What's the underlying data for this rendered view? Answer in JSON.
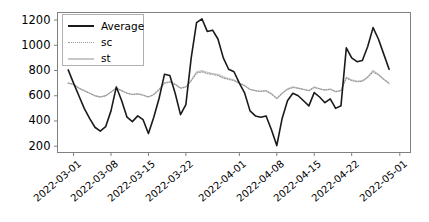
{
  "chart_data": {
    "type": "line",
    "title": "",
    "xlabel": "",
    "ylabel": "",
    "ylim": [
      150,
      1260
    ],
    "xlim": [
      "2022-02-26",
      "2022-05-03"
    ],
    "grid": false,
    "legend_position": "upper left",
    "y_ticks": [
      200,
      400,
      600,
      800,
      1000,
      1200
    ],
    "y_tick_labels": [
      "200",
      "400",
      "600",
      "800",
      "1000",
      "1200"
    ],
    "x_ticks": [
      "2022-03-01",
      "2022-03-08",
      "2022-03-15",
      "2022-03-22",
      "2022-04-01",
      "2022-04-08",
      "2022-04-15",
      "2022-04-22",
      "2022-05-01"
    ],
    "x_tick_labels": [
      "2022-03-01",
      "2022-03-08",
      "2022-03-15",
      "2022-03-22",
      "2022-04-01",
      "2022-04-08",
      "2022-04-15",
      "2022-04-22",
      "2022-05-01"
    ],
    "x": [
      "2022-02-28",
      "2022-03-01",
      "2022-03-02",
      "2022-03-03",
      "2022-03-04",
      "2022-03-05",
      "2022-03-06",
      "2022-03-07",
      "2022-03-08",
      "2022-03-09",
      "2022-03-10",
      "2022-03-11",
      "2022-03-12",
      "2022-03-13",
      "2022-03-14",
      "2022-03-15",
      "2022-03-16",
      "2022-03-17",
      "2022-03-18",
      "2022-03-19",
      "2022-03-20",
      "2022-03-21",
      "2022-03-22",
      "2022-03-23",
      "2022-03-24",
      "2022-03-25",
      "2022-03-26",
      "2022-03-27",
      "2022-03-28",
      "2022-03-29",
      "2022-03-30",
      "2022-03-31",
      "2022-04-01",
      "2022-04-02",
      "2022-04-03",
      "2022-04-04",
      "2022-04-05",
      "2022-04-06",
      "2022-04-07",
      "2022-04-08",
      "2022-04-09",
      "2022-04-10",
      "2022-04-11",
      "2022-04-12",
      "2022-04-13",
      "2022-04-14",
      "2022-04-15",
      "2022-04-16",
      "2022-04-17",
      "2022-04-18",
      "2022-04-19",
      "2022-04-20",
      "2022-04-21",
      "2022-04-22",
      "2022-04-23",
      "2022-04-24",
      "2022-04-25",
      "2022-04-26",
      "2022-04-27",
      "2022-04-28",
      "2022-04-29"
    ],
    "series": [
      {
        "name": "Average",
        "color": "#1a1a1a",
        "linestyle": "solid",
        "linewidth": 1.6,
        "values": [
          805,
          700,
          600,
          500,
          420,
          350,
          320,
          355,
          480,
          670,
          560,
          430,
          395,
          440,
          410,
          300,
          430,
          580,
          770,
          760,
          620,
          450,
          530,
          900,
          1180,
          1210,
          1110,
          1120,
          1050,
          900,
          810,
          790,
          700,
          620,
          480,
          440,
          430,
          440,
          330,
          205,
          420,
          560,
          620,
          600,
          560,
          520,
          625,
          590,
          545,
          575,
          500,
          520,
          980,
          900,
          870,
          880,
          990,
          1140,
          1050,
          930,
          810
        ]
      },
      {
        "name": "sc",
        "color": "#9a9a9a",
        "linestyle": "dotted",
        "linewidth": 1.2,
        "values": [
          700,
          690,
          660,
          640,
          620,
          600,
          590,
          600,
          630,
          660,
          640,
          620,
          610,
          615,
          605,
          590,
          610,
          650,
          700,
          710,
          690,
          660,
          670,
          720,
          780,
          790,
          775,
          770,
          760,
          740,
          730,
          720,
          700,
          680,
          650,
          640,
          635,
          640,
          615,
          580,
          620,
          650,
          665,
          660,
          650,
          640,
          665,
          655,
          645,
          650,
          635,
          640,
          740,
          720,
          710,
          715,
          745,
          790,
          765,
          730,
          700
        ]
      },
      {
        "name": "st",
        "color": "#c8c8c8",
        "linestyle": "solid",
        "linewidth": 1.3,
        "values": [
          700,
          690,
          660,
          640,
          620,
          600,
          590,
          600,
          630,
          660,
          640,
          620,
          610,
          615,
          605,
          590,
          610,
          650,
          700,
          710,
          690,
          660,
          670,
          720,
          790,
          800,
          785,
          775,
          770,
          750,
          735,
          725,
          700,
          680,
          650,
          640,
          635,
          640,
          615,
          575,
          620,
          655,
          670,
          660,
          650,
          640,
          670,
          655,
          645,
          655,
          630,
          640,
          745,
          725,
          715,
          720,
          750,
          800,
          770,
          730,
          695
        ]
      }
    ]
  },
  "legend": {
    "entries": [
      {
        "label": "Average",
        "style": "solid-dark"
      },
      {
        "label": "sc",
        "style": "dotted"
      },
      {
        "label": "st",
        "style": "solid-light"
      }
    ]
  },
  "axes": {
    "spine_color": "#808080",
    "tick_color": "#808080",
    "background": "#ffffff"
  }
}
